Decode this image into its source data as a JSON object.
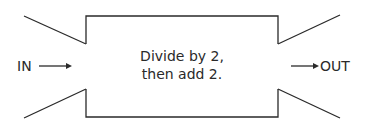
{
  "diagram": {
    "type": "function-machine",
    "input_label": "IN",
    "output_label": "OUT",
    "rule": {
      "line1": "Divide by 2,",
      "line2": "then add 2."
    },
    "colors": {
      "stroke": "#2a2a2a",
      "background": "#ffffff",
      "text": "#2a2a2a"
    }
  }
}
